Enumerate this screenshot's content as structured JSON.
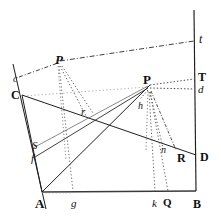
{
  "figure": {
    "type": "geometric-optics-diagram",
    "background_color": "#ffffff",
    "ink_color": "#1a1a1a",
    "width": 221,
    "height": 220,
    "labels": [
      {
        "id": "t",
        "text": "t",
        "style": "italic",
        "size": 12,
        "x": 199,
        "y": 33
      },
      {
        "id": "P-upper",
        "text": "P",
        "style": "bolditalic",
        "size": 13,
        "x": 55,
        "y": 53
      },
      {
        "id": "c",
        "text": "c",
        "style": "italic",
        "size": 10,
        "x": 13,
        "y": 74
      },
      {
        "id": "C",
        "text": "C",
        "style": "bold",
        "size": 12,
        "x": 11,
        "y": 89
      },
      {
        "id": "P-right",
        "text": "P",
        "style": "bold",
        "size": 13,
        "x": 143,
        "y": 73
      },
      {
        "id": "T",
        "text": "T",
        "style": "bold",
        "size": 12,
        "x": 198,
        "y": 71
      },
      {
        "id": "d",
        "text": "d",
        "style": "italic",
        "size": 11,
        "x": 198,
        "y": 84
      },
      {
        "id": "h",
        "text": "h",
        "style": "italic",
        "size": 10,
        "x": 138,
        "y": 101
      },
      {
        "id": "r",
        "text": "r",
        "style": "italic",
        "size": 11,
        "x": 81,
        "y": 106
      },
      {
        "id": "S",
        "text": "S",
        "style": "italic",
        "size": 11,
        "x": 32,
        "y": 140
      },
      {
        "id": "f",
        "text": "f",
        "style": "italic",
        "size": 11,
        "x": 31,
        "y": 153
      },
      {
        "id": "n",
        "text": "n",
        "style": "italic",
        "size": 10,
        "x": 161,
        "y": 145
      },
      {
        "id": "R",
        "text": "R",
        "style": "bold",
        "size": 12,
        "x": 177,
        "y": 152
      },
      {
        "id": "D",
        "text": "D",
        "style": "bold",
        "size": 12,
        "x": 200,
        "y": 151
      },
      {
        "id": "A",
        "text": "A",
        "style": "bold",
        "size": 13,
        "x": 35,
        "y": 197
      },
      {
        "id": "g",
        "text": "g",
        "style": "italic",
        "size": 11,
        "x": 71,
        "y": 198
      },
      {
        "id": "k",
        "text": "k",
        "style": "italic",
        "size": 11,
        "x": 152,
        "y": 198
      },
      {
        "id": "Q",
        "text": "Q",
        "style": "bold",
        "size": 11,
        "x": 163,
        "y": 197
      },
      {
        "id": "B",
        "text": "B",
        "style": "bold",
        "size": 12,
        "x": 193,
        "y": 198
      }
    ],
    "points": {
      "A": [
        42,
        192
      ],
      "B": [
        196,
        191
      ],
      "C": [
        22,
        95
      ],
      "c": [
        19,
        78
      ],
      "D": [
        196,
        155
      ],
      "R": [
        174,
        157
      ],
      "S": [
        32,
        146
      ],
      "f": [
        35,
        157
      ],
      "P_upper": [
        58,
        62
      ],
      "P_right": [
        148,
        86
      ],
      "T": [
        196,
        79
      ],
      "d": [
        196,
        88
      ],
      "t": [
        196,
        41
      ],
      "g": [
        73,
        191
      ],
      "k": [
        155,
        191
      ],
      "Q": [
        168,
        191
      ],
      "h": [
        140,
        96
      ],
      "n": [
        164,
        150
      ],
      "r": [
        88,
        112
      ],
      "top_left_line_start": [
        13,
        64
      ],
      "bottom_left_line_end": [
        46,
        209
      ]
    }
  }
}
